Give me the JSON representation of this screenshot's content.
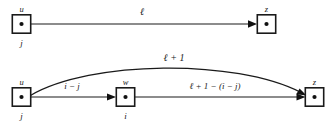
{
  "figure": {
    "title": "",
    "background_color": "#ffffff",
    "stroke_color": "#1a1a1a"
  },
  "panels": [
    {
      "id": "top-panel",
      "name": "direct-edge-panel",
      "nodes": [
        {
          "id": "u-top",
          "label_top": "u",
          "label_bottom": "j",
          "x": 21.5,
          "y": 24
        },
        {
          "id": "z-top",
          "label_top": "z",
          "label_bottom": "",
          "x": 266.5,
          "y": 24
        }
      ],
      "edges": [
        {
          "id": "edge-u-z-top",
          "from": "u-top",
          "to": "z-top",
          "label": "ℓ",
          "shape": "straight"
        }
      ]
    },
    {
      "id": "bottom-panel",
      "name": "split-path-panel",
      "nodes": [
        {
          "id": "u-bottom",
          "label_top": "u",
          "label_bottom": "j",
          "x": 21.5,
          "y": 97
        },
        {
          "id": "w-bottom",
          "label_top": "w",
          "label_bottom": "i",
          "x": 125.5,
          "y": 97
        },
        {
          "id": "z-bottom",
          "label_top": "z",
          "label_bottom": "",
          "x": 314.5,
          "y": 97
        }
      ],
      "edges": [
        {
          "id": "edge-u-z-curve",
          "from": "u-bottom",
          "to": "z-bottom",
          "label": "ℓ + 1",
          "shape": "curve"
        },
        {
          "id": "edge-u-w",
          "from": "u-bottom",
          "to": "w-bottom",
          "label": "i − j",
          "shape": "straight"
        },
        {
          "id": "edge-w-z",
          "from": "w-bottom",
          "to": "z-bottom",
          "label": "ℓ + 1 − (i − j)",
          "shape": "straight"
        }
      ]
    }
  ],
  "labels": {
    "ell": "ℓ",
    "ell_plus_one": "ℓ + 1",
    "i_minus_j": "i − j",
    "ell_plus_one_minus_i_minus_j": "ℓ + 1 − (i − j)",
    "node_u": "u",
    "node_w": "w",
    "node_z": "z",
    "index_j": "j",
    "index_i": "i"
  }
}
